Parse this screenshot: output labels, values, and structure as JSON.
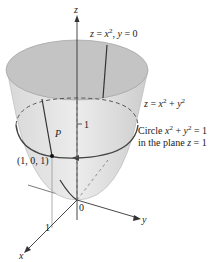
{
  "diagram": {
    "axes": {
      "x": "x",
      "y": "y",
      "z": "z",
      "origin": "0"
    },
    "labels": {
      "parabola_trace": "z = x², y = 0",
      "surface": "z = x² + y²",
      "circle_line1": "Circle x² + y² = 1",
      "circle_line2": "in the plane z = 1",
      "point_name": "P",
      "point_coords": "(1, 0, 1)",
      "z_tick": "1",
      "x_tick": "1"
    },
    "colors": {
      "surface_fill": "#cfcfcf",
      "rim_fill": "#bdbdbd",
      "curve": "#444444",
      "axis": "#333333"
    }
  }
}
